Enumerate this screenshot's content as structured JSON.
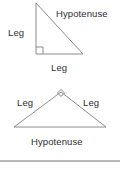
{
  "page": {
    "background_color": "#ffffff",
    "line_color": "#8c8c8c",
    "text_color": "#2e2e2e",
    "divider_color": "#9a9a9a"
  },
  "figures": [
    {
      "id": "right-triangle-vertical",
      "description": "Right triangle with vertical leg on left and horizontal leg on bottom; right angle at bottom-left",
      "vertices": {
        "apex": [
          36,
          3
        ],
        "right_angle": [
          36,
          54
        ],
        "base_right": [
          83,
          54
        ]
      },
      "right_angle_marker": "square",
      "labels": {
        "hypotenuse": "Hypotenuse",
        "leg_vertical": "Leg",
        "leg_horizontal": "Leg"
      }
    },
    {
      "id": "right-triangle-apex",
      "description": "Right triangle resting on its hypotenuse with the right angle at the top apex",
      "vertices": {
        "apex": [
          61,
          92
        ],
        "base_left": [
          14,
          127
        ],
        "base_right": [
          106,
          127
        ]
      },
      "right_angle_marker": "diamond",
      "labels": {
        "leg_left": "Leg",
        "leg_right": "Leg",
        "hypotenuse": "Hypotenuse"
      }
    }
  ],
  "divider": {
    "label": "section-divider"
  }
}
